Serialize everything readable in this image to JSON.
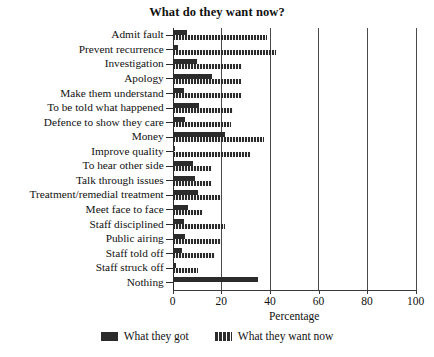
{
  "chart_data": {
    "type": "bar",
    "title": "What do they want now?",
    "xlabel": "Percentage",
    "ylabel": "",
    "orientation": "horizontal",
    "xlim": [
      0,
      100
    ],
    "xticks": [
      0,
      20,
      40,
      60,
      80,
      100
    ],
    "grid": "vertical gridlines at 20, 40, 60, 80, 100",
    "legend_position": "bottom-center",
    "categories": [
      "Admit fault",
      "Prevent recurrence",
      "Investigation",
      "Apology",
      "Make them understand",
      "To be told what happened",
      "Defence to show they care",
      "Money",
      "Improve quality",
      "To hear other side",
      "Talk through issues",
      "Treatment/remedial treatment",
      "Meet face to face",
      "Staff disciplined",
      "Public airing",
      "Staff told off",
      "Staff struck off",
      "Nothing"
    ],
    "series": [
      {
        "name": "What they got",
        "style": "solid",
        "color": "#2b2b2b",
        "values": [
          6,
          2,
          10,
          16,
          4.5,
          11,
          5,
          21.5,
          1,
          8.5,
          9,
          10.5,
          6.5,
          4.5,
          5,
          4,
          1.5,
          35
        ]
      },
      {
        "name": "What they want now",
        "style": "hatched",
        "color": "#2b2b2b",
        "values": [
          39,
          42.5,
          28.5,
          28,
          28,
          25,
          24,
          37.5,
          32,
          16,
          16,
          20,
          12.5,
          21.5,
          20,
          17.5,
          10.5,
          0
        ]
      }
    ]
  },
  "legend": {
    "items": [
      {
        "label": "What they got",
        "swatch": "solid-swatch"
      },
      {
        "label": "What they want now",
        "swatch": "hatched-swatch"
      }
    ]
  }
}
